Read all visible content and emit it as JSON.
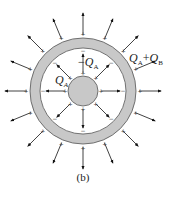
{
  "figure": {
    "caption": "(b)",
    "labels": {
      "inner_sphere_charge": "Q",
      "inner_sphere_sub": "A",
      "shell_inner_charge_sign": "−",
      "shell_inner_charge": "Q",
      "shell_inner_sub": "A",
      "shell_outer_charge_q1": "Q",
      "shell_outer_sub1": "A",
      "shell_outer_plus": "+",
      "shell_outer_charge_q2": "Q",
      "shell_outer_sub2": "B"
    },
    "colors": {
      "fill": "#c8c8c8",
      "stroke": "#555555",
      "arrow": "#111111",
      "background": "#ffffff"
    },
    "geometry": {
      "center": [
        83,
        91
      ],
      "inner_sphere_radius": 15,
      "shell_inner_radius": 43,
      "shell_outer_radius": 53,
      "outer_field_lines": 16,
      "inner_field_lines": 8
    }
  }
}
